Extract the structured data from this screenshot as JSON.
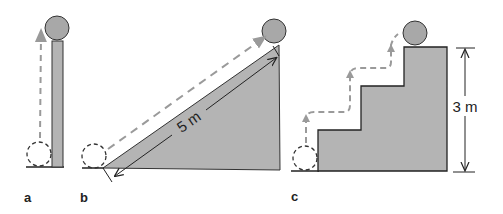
{
  "colors": {
    "fill": "#b4b4b4",
    "ball": "#a8a8a8",
    "stroke": "#222222",
    "dashed_path": "#9a9a9a",
    "background": "#ffffff"
  },
  "panels": [
    {
      "label": "a",
      "description": "vertical pole, ball lifted straight up"
    },
    {
      "label": "b",
      "description": "inclined ramp, ball rolled up slope",
      "dimension": "5 m"
    },
    {
      "label": "c",
      "description": "staircase, ball carried up steps",
      "dimension": "3 m"
    }
  ]
}
